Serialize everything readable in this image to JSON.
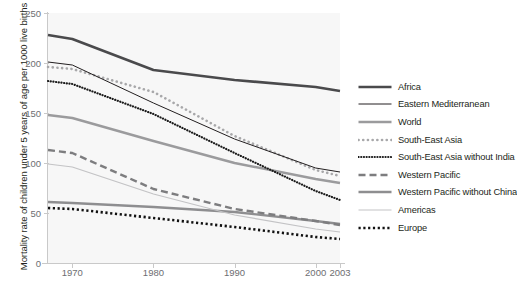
{
  "chart_data": {
    "type": "line",
    "title": "",
    "xlabel": "",
    "ylabel": "Mortality rate of children under 5 years of age per 1000 live births",
    "xlim": [
      1967,
      2003
    ],
    "ylim": [
      0,
      250
    ],
    "xticks": [
      1970,
      1980,
      1990,
      2000,
      2003
    ],
    "xtick_labels": [
      "1970",
      "1980",
      "1990",
      "2000",
      "2003"
    ],
    "yticks": [
      0,
      50,
      100,
      150,
      200,
      250
    ],
    "ytick_labels": [
      "0",
      "50",
      "100",
      "150",
      "200",
      "250"
    ],
    "grid": false,
    "legend_position": "right",
    "x": [
      1967,
      1970,
      1980,
      1990,
      2000,
      2003
    ],
    "series": [
      {
        "name": "Africa",
        "style": "solid",
        "color": "#4a4a4c",
        "width": 2.6,
        "values": [
          228,
          224,
          193,
          183,
          176,
          172
        ]
      },
      {
        "name": "Eastern Mediterranean",
        "style": "solid",
        "color": "#231f20",
        "width": 1.0,
        "values": [
          201,
          198,
          160,
          124,
          95,
          91
        ]
      },
      {
        "name": "World",
        "style": "solid",
        "color": "#9b9b9d",
        "width": 2.4,
        "values": [
          148,
          145,
          122,
          100,
          84,
          80
        ]
      },
      {
        "name": "South-East Asia",
        "style": "dotted-round",
        "color": "#a8a8aa",
        "width": 2.6,
        "values": [
          196,
          194,
          171,
          127,
          93,
          87
        ]
      },
      {
        "name": "South-East Asia without India",
        "style": "dotted-fine",
        "color": "#1a1a1a",
        "width": 2.2,
        "values": [
          182,
          179,
          149,
          110,
          72,
          63
        ]
      },
      {
        "name": "Western Pacific",
        "style": "dashed",
        "color": "#7d7d7f",
        "width": 2.4,
        "values": [
          113,
          110,
          74,
          54,
          42,
          38
        ]
      },
      {
        "name": "Western Pacific without China",
        "style": "solid",
        "color": "#8e8e90",
        "width": 2.4,
        "values": [
          61,
          60,
          56,
          51,
          42,
          39
        ]
      },
      {
        "name": "Americas",
        "style": "solid",
        "color": "#c3c3c5",
        "width": 1.2,
        "values": [
          99,
          96,
          69,
          48,
          34,
          31
        ]
      },
      {
        "name": "Europe",
        "style": "dotted-square",
        "color": "#111111",
        "width": 2.6,
        "values": [
          55,
          54,
          45,
          36,
          26,
          24
        ]
      }
    ]
  },
  "axis": {
    "y_title": "Mortality rate of children under 5 years of age per 1000 live births"
  },
  "legend": {
    "entries": [
      {
        "label": "Africa"
      },
      {
        "label": "Eastern Mediterranean"
      },
      {
        "label": "World"
      },
      {
        "label": "South-East Asia"
      },
      {
        "label": "South-East Asia without India"
      },
      {
        "label": "Western Pacific"
      },
      {
        "label": "Western Pacific without China"
      },
      {
        "label": "Americas"
      },
      {
        "label": "Europe"
      }
    ]
  }
}
